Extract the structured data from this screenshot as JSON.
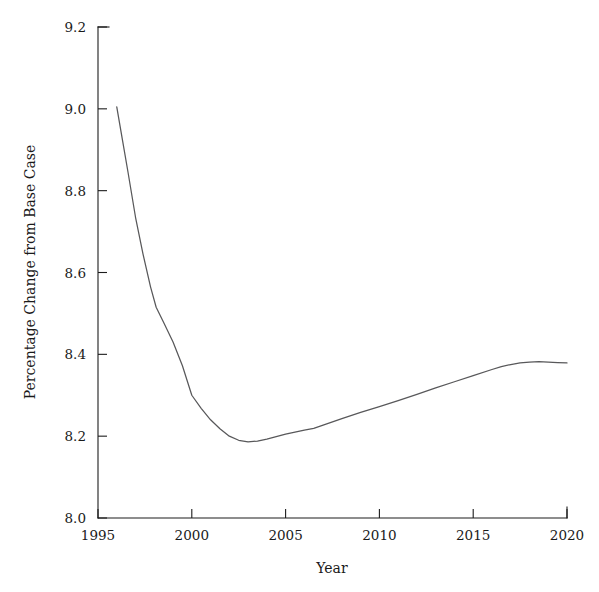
{
  "chart_data": {
    "type": "line",
    "title": "",
    "xlabel": "Year",
    "ylabel": "Percentage Change from Base Case",
    "xlim": [
      1995,
      2020
    ],
    "ylim": [
      8.0,
      9.2
    ],
    "xticks": [
      1995,
      2000,
      2005,
      2010,
      2015,
      2020
    ],
    "xtick_labels": [
      "1995",
      "2000",
      "2005",
      "2010",
      "2015",
      "2020"
    ],
    "yticks": [
      8.0,
      8.2,
      8.4,
      8.6,
      8.8,
      9.0,
      9.2
    ],
    "ytick_labels": [
      "8.0",
      "8.2",
      "8.4",
      "8.6",
      "8.8",
      "9.0",
      "9.2"
    ],
    "grid": false,
    "legend": false,
    "legend_position": "none",
    "line_color": "#58585a",
    "axis_color": "#1c1c1c",
    "background_color": "#ffffff",
    "series": [
      {
        "name": "Percentage Change from Base Case",
        "x": [
          1996.0,
          1996.3,
          1996.6,
          1997.0,
          1997.4,
          1997.8,
          1998.1,
          1998.5,
          1999.0,
          1999.5,
          2000.0,
          2000.5,
          2001.0,
          2001.5,
          2002.0,
          2002.5,
          2003.0,
          2003.5,
          2004.0,
          2004.5,
          2005.0,
          2005.5,
          2006.0,
          2006.5,
          2007.0,
          2008.0,
          2009.0,
          2010.0,
          2011.0,
          2012.0,
          2013.0,
          2014.0,
          2015.0,
          2016.0,
          2016.5,
          2017.0,
          2017.5,
          2018.0,
          2018.5,
          2019.0,
          2019.5,
          2020.0
        ],
        "y": [
          9.005,
          8.925,
          8.845,
          8.735,
          8.645,
          8.565,
          8.515,
          8.478,
          8.43,
          8.372,
          8.3,
          8.268,
          8.24,
          8.218,
          8.2,
          8.19,
          8.186,
          8.188,
          8.193,
          8.199,
          8.205,
          8.21,
          8.215,
          8.219,
          8.227,
          8.243,
          8.258,
          8.272,
          8.287,
          8.302,
          8.318,
          8.333,
          8.348,
          8.363,
          8.37,
          8.375,
          8.379,
          8.381,
          8.382,
          8.381,
          8.38,
          8.379
        ]
      }
    ],
    "annotations": []
  }
}
